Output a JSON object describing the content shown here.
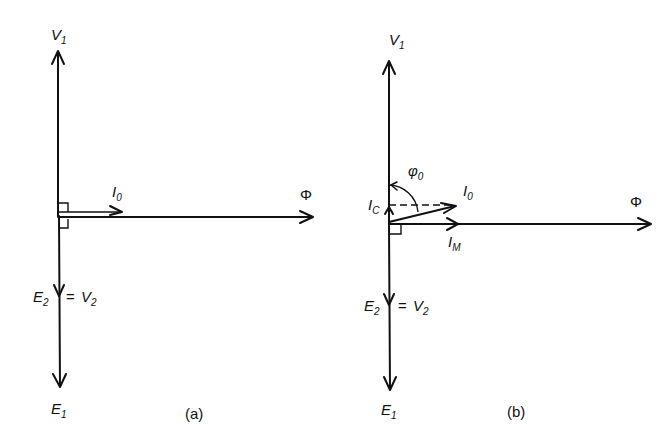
{
  "diagram": {
    "panel_a": {
      "caption": "(a)",
      "labels": {
        "v1": {
          "main": "V",
          "sub": "1"
        },
        "i0": {
          "main": "I",
          "sub": "0"
        },
        "phi": "Φ",
        "e2": {
          "main": "E",
          "sub": "2"
        },
        "eq": "=",
        "v2": {
          "main": "V",
          "sub": "2"
        },
        "e1": {
          "main": "E",
          "sub": "1"
        }
      }
    },
    "panel_b": {
      "caption": "(b)",
      "labels": {
        "v1": {
          "main": "V",
          "sub": "1"
        },
        "phi0": {
          "main": "φ",
          "sub": "0"
        },
        "i0": {
          "main": "I",
          "sub": "0"
        },
        "ic": {
          "main": "I",
          "sub": "C"
        },
        "im": {
          "main": "I",
          "sub": "M"
        },
        "phi": "Φ",
        "e2": {
          "main": "E",
          "sub": "2"
        },
        "eq": "=",
        "v2": {
          "main": "V",
          "sub": "2"
        },
        "e1": {
          "main": "E",
          "sub": "1"
        }
      }
    }
  }
}
